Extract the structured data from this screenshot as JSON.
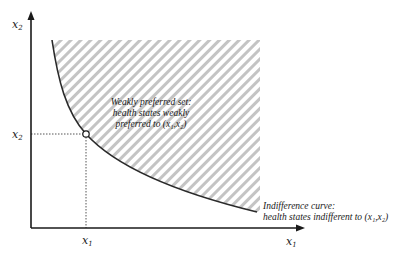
{
  "diagram": {
    "type": "indifference-curve",
    "axes": {
      "x_label": "x",
      "x_label_sub": "1",
      "y_label": "x",
      "y_label_sub": "2"
    },
    "point": {
      "x_tick_label": "x",
      "x_tick_sub": "1",
      "y_tick_label": "x",
      "y_tick_sub": "2"
    },
    "weakly_preferred_set": {
      "line1": "Weakly preferred set:",
      "line2": "health states weakly",
      "line3": "preferred to (x₁,x₂)"
    },
    "indifference_curve": {
      "line1": "Indifference curve:",
      "line2": "health states indifferent to (x₁,x₂)"
    },
    "colors": {
      "axis": "#1a1a1a",
      "curve": "#2a2a2a",
      "hatch": "#b8b8b8",
      "guide": "#555555"
    }
  }
}
